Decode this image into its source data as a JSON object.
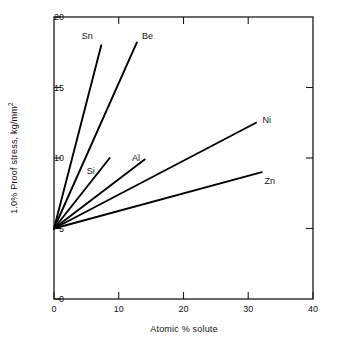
{
  "figure": {
    "background_color": "#ffffff",
    "line_color": "#000000",
    "axis_color": "#1a1a1a"
  },
  "axes": {
    "x_title": "Atomic % solute",
    "y_title_main": "1.0% Proof stress, kg/mm",
    "y_title_exponent": "2",
    "x_ticks": [
      "0",
      "10",
      "20",
      "30",
      "40"
    ],
    "y_ticks": [
      "0",
      "5",
      "10",
      "15",
      "20"
    ]
  },
  "chart_data": {
    "type": "line",
    "title": "",
    "xlabel": "Atomic % solute",
    "ylabel": "1.0% Proof stress, kg/mm2",
    "xlim": [
      0,
      40
    ],
    "ylim": [
      0,
      20
    ],
    "xticks": [
      0,
      10,
      20,
      30,
      40
    ],
    "yticks": [
      0,
      5,
      10,
      15,
      20
    ],
    "grid": false,
    "legend": "inline-end-labels",
    "common_origin": [
      0,
      5
    ],
    "series": [
      {
        "name": "Sn",
        "label": "Sn",
        "x": [
          0,
          7.3
        ],
        "y": [
          5.0,
          18.0
        ],
        "label_x": 6.0,
        "label_y": 18.6,
        "label_anchor": "end"
      },
      {
        "name": "Be",
        "label": "Be",
        "x": [
          0,
          12.8
        ],
        "y": [
          5.0,
          18.2
        ],
        "label_x": 13.6,
        "label_y": 18.6,
        "label_anchor": "start"
      },
      {
        "name": "Si",
        "label": "Si",
        "x": [
          0,
          8.6
        ],
        "y": [
          5.0,
          10.0
        ],
        "label_x": 6.3,
        "label_y": 9.0,
        "label_anchor": "end"
      },
      {
        "name": "Al",
        "label": "Al",
        "x": [
          0,
          14.0
        ],
        "y": [
          5.0,
          9.9
        ],
        "label_x": 13.3,
        "label_y": 9.9,
        "label_anchor": "end"
      },
      {
        "name": "Ni",
        "label": "Ni",
        "x": [
          0,
          31.2
        ],
        "y": [
          5.0,
          12.5
        ],
        "label_x": 32.2,
        "label_y": 12.6,
        "label_anchor": "start"
      },
      {
        "name": "Zn",
        "label": "Zn",
        "x": [
          0,
          32.1
        ],
        "y": [
          5.0,
          9.0
        ],
        "label_x": 32.5,
        "label_y": 8.3,
        "label_anchor": "start"
      }
    ]
  }
}
